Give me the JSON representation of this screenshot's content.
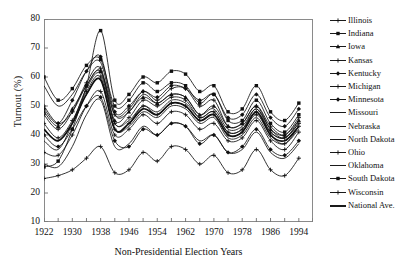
{
  "chart_data": {
    "type": "line",
    "title": "",
    "xlabel": "Non-Presidential Election Years",
    "ylabel": "Turnout (%)",
    "xlim": [
      1922,
      1998
    ],
    "ylim": [
      10,
      80
    ],
    "yticks": [
      10,
      20,
      30,
      40,
      50,
      60,
      70,
      80
    ],
    "xticks": [
      1922,
      1926,
      1930,
      1934,
      1938,
      1942,
      1946,
      1950,
      1954,
      1958,
      1962,
      1966,
      1970,
      1974,
      1978,
      1982,
      1986,
      1990,
      1994,
      1998
    ],
    "xticklabels": [
      "1922",
      "",
      "1930",
      "",
      "1938",
      "",
      "1946",
      "",
      "1954",
      "",
      "1962",
      "",
      "1970",
      "",
      "1978",
      "",
      "1986",
      "",
      "1994",
      ""
    ],
    "grid": false,
    "legend_position": "right",
    "x": [
      1922,
      1926,
      1930,
      1934,
      1938,
      1942,
      1946,
      1950,
      1954,
      1958,
      1962,
      1966,
      1970,
      1974,
      1978,
      1982,
      1986,
      1990,
      1994
    ],
    "series": [
      {
        "name": "Illinois",
        "marker": "cross",
        "values": [
          50,
          44,
          48,
          57,
          62,
          47,
          49,
          55,
          52,
          56,
          56,
          50,
          52,
          43,
          44,
          50,
          43,
          40,
          46
        ]
      },
      {
        "name": "Indiana",
        "marker": "square",
        "values": [
          60,
          52,
          56,
          64,
          66,
          50,
          52,
          58,
          55,
          58,
          57,
          51,
          54,
          45,
          45,
          52,
          44,
          41,
          47
        ]
      },
      {
        "name": "Iowa",
        "marker": "triangle",
        "values": [
          48,
          43,
          49,
          57,
          62,
          45,
          48,
          53,
          51,
          54,
          53,
          47,
          50,
          43,
          44,
          50,
          42,
          40,
          45
        ]
      },
      {
        "name": "Kansas",
        "marker": "cross",
        "values": [
          47,
          42,
          48,
          58,
          63,
          44,
          46,
          52,
          50,
          53,
          52,
          46,
          48,
          41,
          42,
          48,
          41,
          39,
          44
        ]
      },
      {
        "name": "Kentucky",
        "marker": "diamond",
        "values": [
          40,
          36,
          42,
          50,
          53,
          38,
          36,
          42,
          40,
          44,
          43,
          37,
          40,
          34,
          36,
          42,
          35,
          33,
          38
        ]
      },
      {
        "name": "Michigan",
        "marker": "cross",
        "values": [
          44,
          39,
          45,
          55,
          60,
          42,
          44,
          50,
          47,
          51,
          50,
          45,
          47,
          40,
          41,
          47,
          40,
          37,
          43
        ]
      },
      {
        "name": "Minnesota",
        "marker": "diamond",
        "values": [
          49,
          44,
          52,
          62,
          67,
          48,
          50,
          55,
          53,
          57,
          56,
          52,
          54,
          46,
          47,
          54,
          46,
          43,
          49
        ]
      },
      {
        "name": "Missouri",
        "marker": "line",
        "values": [
          57,
          50,
          54,
          62,
          65,
          47,
          48,
          54,
          51,
          54,
          53,
          47,
          49,
          42,
          43,
          49,
          42,
          39,
          45
        ]
      },
      {
        "name": "Nebraska",
        "marker": "line",
        "values": [
          42,
          38,
          44,
          54,
          59,
          42,
          43,
          48,
          46,
          50,
          49,
          44,
          46,
          39,
          40,
          46,
          39,
          37,
          42
        ]
      },
      {
        "name": "North Dakota",
        "marker": "line",
        "values": [
          38,
          35,
          44,
          56,
          61,
          44,
          45,
          50,
          48,
          52,
          51,
          46,
          48,
          41,
          42,
          49,
          41,
          39,
          44
        ]
      },
      {
        "name": "Ohio",
        "marker": "cross",
        "values": [
          34,
          33,
          40,
          50,
          55,
          40,
          42,
          47,
          44,
          48,
          47,
          42,
          44,
          38,
          39,
          45,
          38,
          35,
          41
        ]
      },
      {
        "name": "Oklahoma",
        "marker": "line",
        "values": [
          30,
          29,
          36,
          47,
          52,
          36,
          37,
          43,
          40,
          44,
          43,
          38,
          40,
          34,
          35,
          41,
          34,
          32,
          37
        ]
      },
      {
        "name": "South Dakota",
        "marker": "square",
        "values": [
          29,
          31,
          42,
          57,
          76,
          52,
          54,
          60,
          58,
          62,
          61,
          55,
          57,
          48,
          49,
          57,
          48,
          45,
          51
        ]
      },
      {
        "name": "Wisconsin",
        "marker": "cross",
        "values": [
          25,
          26,
          28,
          32,
          36,
          27,
          28,
          34,
          31,
          36,
          35,
          30,
          33,
          27,
          28,
          35,
          28,
          26,
          32
        ]
      },
      {
        "name": "National Ave.",
        "marker": "thickline",
        "values": [
          42,
          38,
          44,
          54,
          59,
          42,
          44,
          49,
          47,
          51,
          50,
          45,
          47,
          40,
          41,
          48,
          40,
          38,
          43
        ]
      }
    ]
  },
  "legend": {
    "items": [
      {
        "label": "Illinois"
      },
      {
        "label": "Indiana"
      },
      {
        "label": "Iowa"
      },
      {
        "label": "Kansas"
      },
      {
        "label": "Kentucky"
      },
      {
        "label": "Michigan"
      },
      {
        "label": "Minnesota"
      },
      {
        "label": "Missouri"
      },
      {
        "label": "Nebraska"
      },
      {
        "label": "North Dakota"
      },
      {
        "label": "Ohio"
      },
      {
        "label": "Oklahoma"
      },
      {
        "label": "South Dakota"
      },
      {
        "label": "Wisconsin"
      },
      {
        "label": "National Ave."
      }
    ]
  },
  "colors": {
    "line": "#1a1a1a",
    "frame": "#8a8a8a",
    "text": "#111111",
    "background": "#ffffff"
  }
}
